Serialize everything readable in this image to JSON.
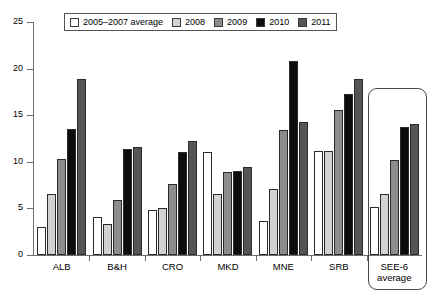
{
  "chart_data": {
    "type": "bar",
    "title": "",
    "xlabel": "",
    "ylabel": "",
    "ylim": [
      0,
      25
    ],
    "yticks": [
      0,
      5,
      10,
      15,
      20,
      25
    ],
    "grid": false,
    "legend_position": "top",
    "categories": [
      "ALB",
      "B&H",
      "CRO",
      "MKD",
      "MNE",
      "SRB",
      "SEE-6 average"
    ],
    "series": [
      {
        "name": "2005–2007 average",
        "color": "#ffffff",
        "values": [
          3.0,
          4.1,
          4.8,
          11.1,
          3.7,
          11.2,
          5.2
        ]
      },
      {
        "name": "2008",
        "color": "#d2d2d2",
        "values": [
          6.5,
          3.3,
          5.0,
          6.6,
          7.1,
          11.2,
          6.5
        ]
      },
      {
        "name": "2009",
        "color": "#8c8c8c",
        "values": [
          10.3,
          5.9,
          7.6,
          8.9,
          13.4,
          15.6,
          10.2
        ]
      },
      {
        "name": "2010",
        "color": "#0d0d0d",
        "values": [
          13.5,
          11.4,
          11.1,
          9.0,
          20.8,
          17.3,
          13.7
        ]
      },
      {
        "name": "2011",
        "color": "#555555",
        "values": [
          18.9,
          11.6,
          12.2,
          9.4,
          14.3,
          18.9,
          14.1
        ]
      }
    ],
    "highlighted_category": "SEE-6 average"
  },
  "axis": {
    "y_labels": [
      "25",
      "20",
      "15",
      "10",
      "5",
      "0"
    ]
  }
}
